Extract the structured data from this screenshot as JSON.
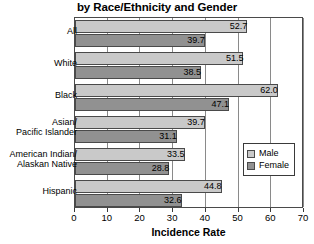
{
  "chart_data": {
    "type": "bar",
    "orientation": "horizontal",
    "title": "by Race/Ethnicity and Gender",
    "xlabel": "Incidence Rate",
    "ylabel": "",
    "xlim": [
      0,
      70
    ],
    "xticks": [
      0,
      10,
      20,
      30,
      40,
      50,
      60,
      70
    ],
    "grid": true,
    "grid_axis": "x",
    "legend_position": "right",
    "categories": [
      "All",
      "White",
      "Black",
      "Asian/\nPacific Islander",
      "American Indian/\nAlaskan Native",
      "Hispanic"
    ],
    "series": [
      {
        "name": "Male",
        "color": "#c9c9c9",
        "values": [
          52.7,
          51.5,
          62.0,
          39.7,
          33.5,
          44.8
        ]
      },
      {
        "name": "Female",
        "color": "#919191",
        "values": [
          39.7,
          38.5,
          47.1,
          31.1,
          28.8,
          32.6
        ]
      }
    ],
    "value_labels": {
      "Male": [
        "52.7",
        "51.5",
        "62.0",
        "39.7",
        "33.5",
        "44.8"
      ],
      "Female": [
        "39.7",
        "38.5",
        "47.1",
        "31.1",
        "28.8",
        "32.6"
      ]
    }
  },
  "category_labels": [
    {
      "line1": "All",
      "line2": ""
    },
    {
      "line1": "White",
      "line2": ""
    },
    {
      "line1": "Black",
      "line2": ""
    },
    {
      "line1": "Asian/",
      "line2": "Pacific Islander"
    },
    {
      "line1": "American Indian/",
      "line2": "Alaskan Native"
    },
    {
      "line1": "Hispanic",
      "line2": ""
    }
  ],
  "axis": {
    "tick_labels": [
      "0",
      "10",
      "20",
      "30",
      "40",
      "50",
      "60",
      "70"
    ],
    "title": "Incidence Rate"
  },
  "legend": {
    "items": [
      {
        "label": "Male"
      },
      {
        "label": "Female"
      }
    ]
  },
  "colors": {
    "male": "#c9c9c9",
    "female": "#919191",
    "frame": "#4a4a4a",
    "grid": "#8a8a8a",
    "background": "#ffffff"
  }
}
